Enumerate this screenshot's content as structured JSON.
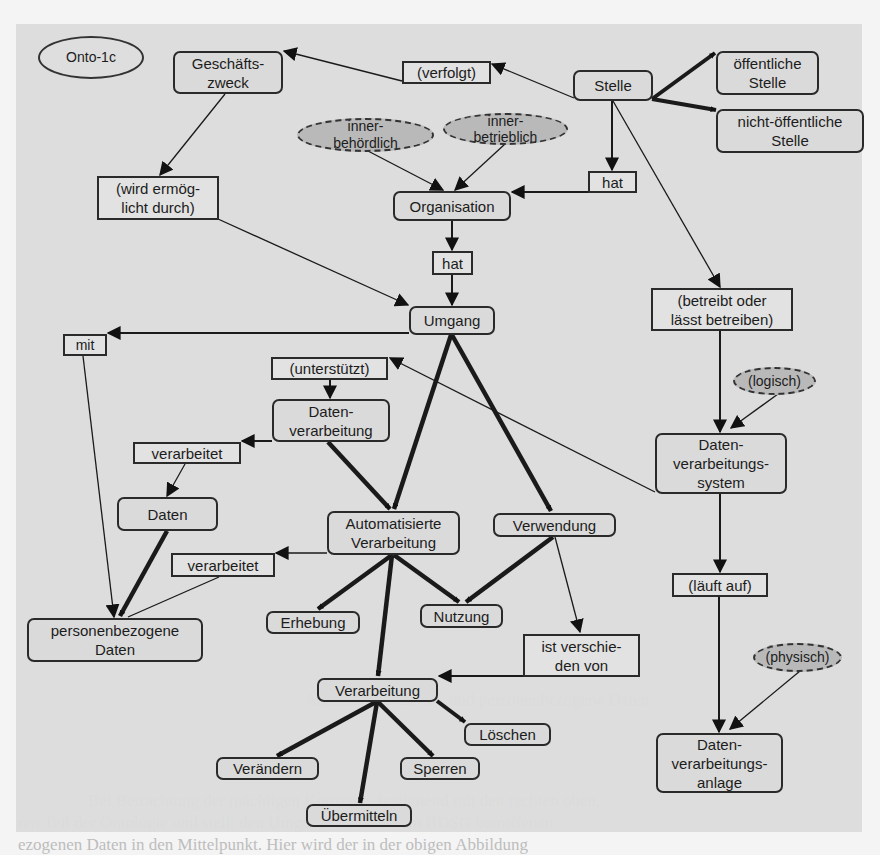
{
  "diagram": {
    "label": "Onto-1c",
    "nodes": {
      "onto": "Onto-1c",
      "geschaeftszweck": "Geschäfts-\nzweck",
      "verfolgt": "(verfolgt)",
      "stelle": "Stelle",
      "oeffentliche_stelle": "öffentliche\nStelle",
      "nicht_oeffentliche_stelle": "nicht-öffentliche\nStelle",
      "innerbehoerdlich": "inner-\nbehördlich",
      "innerbetrieblich": "inner-\nbetrieblich",
      "hat_1": "hat",
      "organisation": "Organisation",
      "wird_ermoeglicht_durch": "(wird ermög-\nlicht durch)",
      "hat_2": "hat",
      "umgang": "Umgang",
      "betreibt": "(betreibt oder\nlässt betreiben)",
      "mit": "mit",
      "unterstuetzt": "(unterstützt)",
      "datenverarbeitung": "Daten-\nverarbeitung",
      "verarbeitet_1": "verarbeitet",
      "daten": "Daten",
      "logisch": "(logisch)",
      "dv_system": "Daten-\nverarbeitungs-\nsystem",
      "automatisierte_verarbeitung": "Automatisierte\nVerarbeitung",
      "verwendung": "Verwendung",
      "verarbeitet_2": "verarbeitet",
      "personenbezogene_daten": "personenbezogene\nDaten",
      "erhebung": "Erhebung",
      "nutzung": "Nutzung",
      "laeuft_auf": "(läuft auf)",
      "ist_verschieden_von": "ist verschie-\nden von",
      "verarbeitung": "Verarbeitung",
      "physisch": "(physisch)",
      "loeschen": "Löschen",
      "dv_anlage": "Daten-\nverarbeitungs-\nanlage",
      "veraendern": "Verändern",
      "sperren": "Sperren",
      "uebermitteln": "Übermitteln"
    },
    "edges": [
      {
        "from": "Stelle",
        "to": "(verfolgt)",
        "weight": "thin"
      },
      {
        "from": "(verfolgt)",
        "to": "Geschäftszweck",
        "weight": "thin"
      },
      {
        "from": "Stelle",
        "to": "öffentliche Stelle",
        "weight": "thick"
      },
      {
        "from": "Stelle",
        "to": "nicht-öffentliche Stelle",
        "weight": "thick"
      },
      {
        "from": "Stelle",
        "to": "hat",
        "weight": "normal"
      },
      {
        "from": "hat",
        "to": "Organisation",
        "weight": "normal"
      },
      {
        "from": "inner-behördlich",
        "to": "Organisation",
        "weight": "thin"
      },
      {
        "from": "inner-betrieblich",
        "to": "Organisation",
        "weight": "thin"
      },
      {
        "from": "Geschäftszweck",
        "to": "(wird ermöglicht durch)",
        "weight": "thin"
      },
      {
        "from": "(wird ermöglicht durch)",
        "to": "Umgang",
        "weight": "thin"
      },
      {
        "from": "Organisation",
        "to": "hat",
        "weight": "normal"
      },
      {
        "from": "hat",
        "to": "Umgang",
        "weight": "normal"
      },
      {
        "from": "Stelle",
        "to": "(betreibt oder lässt betreiben)",
        "weight": "thin"
      },
      {
        "from": "(betreibt oder lässt betreiben)",
        "to": "Datenverarbeitungssystem",
        "weight": "normal"
      },
      {
        "from": "(logisch)",
        "to": "Datenverarbeitungssystem",
        "weight": "thin"
      },
      {
        "from": "Umgang",
        "to": "mit",
        "weight": "normal"
      },
      {
        "from": "mit",
        "to": "personenbezogene Daten",
        "weight": "thin"
      },
      {
        "from": "Datenverarbeitungssystem",
        "to": "(unterstützt)",
        "weight": "thin"
      },
      {
        "from": "(unterstützt)",
        "to": "Datenverarbeitung",
        "weight": "normal"
      },
      {
        "from": "Datenverarbeitung",
        "to": "verarbeitet",
        "weight": "normal"
      },
      {
        "from": "verarbeitet",
        "to": "Daten",
        "weight": "thin"
      },
      {
        "from": "Daten",
        "to": "personenbezogene Daten",
        "weight": "thick"
      },
      {
        "from": "Datenverarbeitung",
        "to": "Automatisierte Verarbeitung",
        "weight": "thick"
      },
      {
        "from": "Umgang",
        "to": "Automatisierte Verarbeitung",
        "weight": "thick"
      },
      {
        "from": "Umgang",
        "to": "Verwendung",
        "weight": "thick"
      },
      {
        "from": "Automatisierte Verarbeitung",
        "to": "verarbeitet",
        "weight": "normal"
      },
      {
        "from": "verarbeitet",
        "to": "personenbezogene Daten",
        "weight": "thin"
      },
      {
        "from": "Automatisierte Verarbeitung",
        "to": "Erhebung",
        "weight": "thick"
      },
      {
        "from": "Automatisierte Verarbeitung",
        "to": "Nutzung",
        "weight": "thick"
      },
      {
        "from": "Automatisierte Verarbeitung",
        "to": "Verarbeitung",
        "weight": "thick"
      },
      {
        "from": "Verwendung",
        "to": "Nutzung",
        "weight": "thick"
      },
      {
        "from": "Verwendung",
        "to": "ist verschieden von",
        "weight": "thin"
      },
      {
        "from": "ist verschieden von",
        "to": "Verarbeitung",
        "weight": "normal"
      },
      {
        "from": "Datenverarbeitungssystem",
        "to": "(läuft auf)",
        "weight": "normal"
      },
      {
        "from": "(läuft auf)",
        "to": "Datenverarbeitungsanlage",
        "weight": "normal"
      },
      {
        "from": "(physisch)",
        "to": "Datenverarbeitungsanlage",
        "weight": "thin"
      },
      {
        "from": "Verarbeitung",
        "to": "Löschen",
        "weight": "thick"
      },
      {
        "from": "Verarbeitung",
        "to": "Verändern",
        "weight": "thick"
      },
      {
        "from": "Verarbeitung",
        "to": "Sperren",
        "weight": "thick"
      },
      {
        "from": "Verarbeitung",
        "to": "Übermitteln",
        "weight": "thick"
      }
    ],
    "colors": {
      "panel": "#dcdcdc",
      "page": "#f4f4f4",
      "ink": "#1c1c1c",
      "ellipse_fill": "#b9b9b9"
    }
  },
  "background_text": {
    "caption": "Abbildung 2: BDSG und personenbezogene Daten",
    "lines": [
      "Bei Betrachtung der mächtigen Konzepte, beginnend mit den rechten oben,",
      "ren Teil der Ontologie und stellt den Umgang mit dem vom BDSG betroffenen",
      "ezogenen Daten in den Mittelpunkt. Hier wird der in der obigen Abbildung"
    ]
  }
}
